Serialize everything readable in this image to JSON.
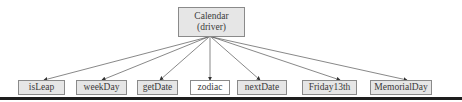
{
  "diagram": {
    "root": {
      "label_line1": "Calendar",
      "label_line2": "(driver)"
    },
    "children": [
      {
        "label": "isLeap",
        "shaded": true
      },
      {
        "label": "weekDay",
        "shaded": true
      },
      {
        "label": "getDate",
        "shaded": true
      },
      {
        "label": "zodiac",
        "shaded": false
      },
      {
        "label": "nextDate",
        "shaded": true
      },
      {
        "label": "Friday13th",
        "shaded": true
      },
      {
        "label": "MemorialDay",
        "shaded": true
      }
    ],
    "edge_color": "#555555",
    "box_fill": "#e6e6e6"
  }
}
